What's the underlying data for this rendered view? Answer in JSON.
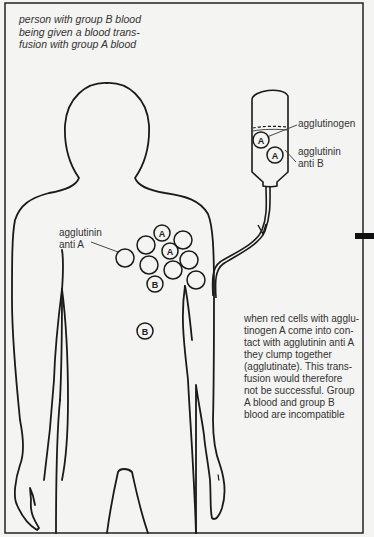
{
  "caption": {
    "lines": [
      "person with group B blood",
      "being given a blood trans-",
      "fusion with group A blood"
    ]
  },
  "labels": {
    "agglutinogen": "agglutinogen",
    "agglutinin_anti_b": [
      "agglutinin",
      "anti B"
    ],
    "agglutinin_anti_a": [
      "agglutinin",
      "anti A"
    ]
  },
  "cells": {
    "bag": [
      "A",
      "A"
    ],
    "body_cluster_labeled": [
      "A",
      "A",
      "B"
    ],
    "body_lone": "B"
  },
  "explanation": {
    "lines": [
      "when red cells with agglu-",
      "tinogen A come into con-",
      "tact with agglutinin anti A",
      "they clump together",
      "(agglutinate). This trans-",
      "fusion would therefore",
      "not be successful. Group",
      "A blood and group B",
      "blood are incompatible"
    ]
  },
  "colors": {
    "background": "#f4f4f2",
    "line": "#1a1a1a",
    "text": "#333333"
  }
}
